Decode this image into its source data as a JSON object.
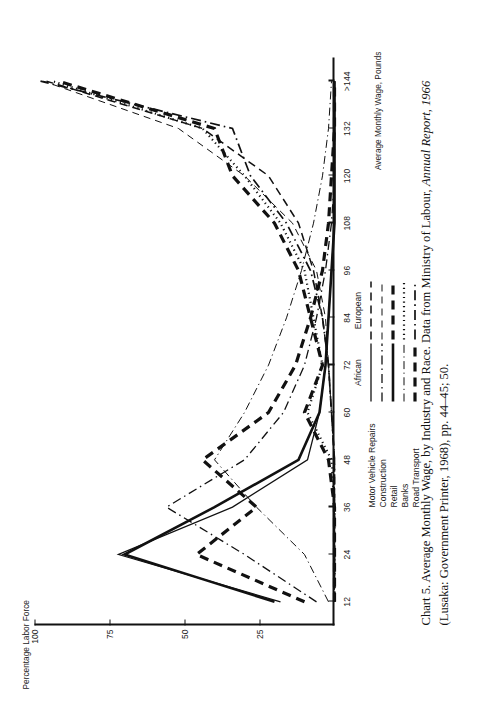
{
  "caption": {
    "prefix": "Chart 5. Average Monthly Wage, by Industry and Race. Data from Ministry of Labour, ",
    "italic1": "Annual Report, 1966",
    "middle": " (Lusaka: Government Printer, 1968), pp. 44–45; 50."
  },
  "legend": {
    "col_african": "African",
    "col_european": "European",
    "rows": [
      {
        "label": "Motor Vehicle Repairs",
        "african_style": "solid-thin",
        "european_style": "dashed-med"
      },
      {
        "label": "Construction",
        "african_style": "dash-dot-thin",
        "european_style": "dashed-thin"
      },
      {
        "label": "Retail",
        "african_style": "solid-thick",
        "european_style": "dashed-thick"
      },
      {
        "label": "Banks",
        "african_style": "dash-dot-fine",
        "european_style": "dotted"
      },
      {
        "label": "Road Transport",
        "african_style": "dashed-thick",
        "european_style": "dash-dot-med"
      }
    ]
  },
  "chart_data": {
    "type": "line",
    "title": "Chart 5. Average Monthly Wage, by Industry and Race",
    "xlabel": "Average Monthly Wage, Pounds",
    "ylabel": "Percentage Labor Force",
    "grid": false,
    "legend_position": "below-plot-left",
    "xticklabels": [
      "12",
      "24",
      "36",
      "48",
      "60",
      "72",
      "84",
      "96",
      "108",
      "120",
      "132",
      ">144"
    ],
    "x": [
      12,
      24,
      36,
      48,
      60,
      72,
      84,
      96,
      108,
      120,
      132,
      144
    ],
    "xlim": [
      6,
      150
    ],
    "ylim": [
      0,
      100
    ],
    "yticklabels": [
      "25",
      "50",
      "75",
      "100"
    ],
    "yticks": [
      25,
      50,
      75,
      100
    ],
    "series": [
      {
        "name": "Motor Vehicle Repairs — African",
        "race": "African",
        "industry": "Motor Vehicle Repairs",
        "style": "solid-thin",
        "values": [
          18,
          72,
          34,
          9,
          5,
          3,
          2,
          1,
          0,
          0,
          0,
          0
        ]
      },
      {
        "name": "Construction — African",
        "race": "African",
        "industry": "Construction",
        "style": "dash-dot-thin",
        "values": [
          6,
          30,
          56,
          30,
          17,
          10,
          6,
          3,
          1,
          0,
          0,
          0
        ]
      },
      {
        "name": "Retail — African",
        "race": "African",
        "industry": "Retail",
        "style": "solid-thick",
        "values": [
          20,
          70,
          40,
          12,
          5,
          3,
          2,
          1,
          0,
          0,
          0,
          0
        ]
      },
      {
        "name": "Banks — African",
        "race": "African",
        "industry": "Banks",
        "style": "dash-dot-fine",
        "values": [
          2,
          10,
          26,
          40,
          30,
          22,
          16,
          11,
          7,
          4,
          2,
          1
        ]
      },
      {
        "name": "Road Transport — African",
        "race": "African",
        "industry": "Road Transport",
        "style": "dashed-thick",
        "values": [
          10,
          46,
          26,
          44,
          22,
          13,
          8,
          4,
          2,
          1,
          0,
          0
        ]
      },
      {
        "name": "Motor Vehicle Repairs — European",
        "race": "European",
        "industry": "Motor Vehicle Repairs",
        "style": "dashed-med",
        "values": [
          0,
          0,
          0,
          0,
          1,
          2,
          4,
          7,
          12,
          22,
          44,
          96
        ]
      },
      {
        "name": "Construction — European",
        "race": "European",
        "industry": "Construction",
        "style": "dashed-thin",
        "values": [
          0,
          0,
          0,
          0,
          1,
          2,
          3,
          6,
          14,
          30,
          52,
          97
        ]
      },
      {
        "name": "Retail — European",
        "race": "European",
        "industry": "Retail",
        "style": "dashed-thick",
        "values": [
          0,
          0,
          0,
          2,
          10,
          4,
          8,
          12,
          20,
          34,
          40,
          92
        ]
      },
      {
        "name": "Banks — European",
        "race": "European",
        "industry": "Banks",
        "style": "dotted",
        "values": [
          0,
          0,
          0,
          1,
          9,
          4,
          7,
          10,
          18,
          30,
          44,
          94
        ]
      },
      {
        "name": "Road Transport — European",
        "race": "European",
        "industry": "Road Transport",
        "style": "dash-dot-med",
        "values": [
          0,
          0,
          0,
          0,
          1,
          2,
          4,
          8,
          16,
          28,
          34,
          98
        ]
      }
    ]
  }
}
